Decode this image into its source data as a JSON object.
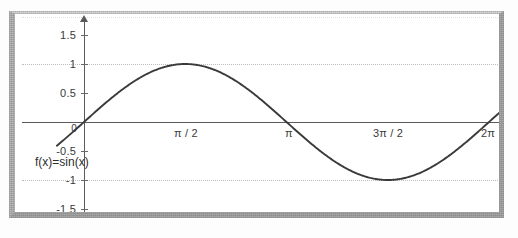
{
  "figure": {
    "series_label": "f(x)=sin(x)",
    "frame_color": "#a9a9a9",
    "curve_color": "#3a3a3a",
    "grid_color": "#bdbdbd",
    "axis_color": "#5a5a5a"
  },
  "chart_data": {
    "type": "line",
    "title": "",
    "subtitle": "",
    "xlabel": "",
    "ylabel": "",
    "grid": true,
    "legend_position": "inline-left",
    "annotations": [
      "f(x)=sin(x)"
    ],
    "series": [
      {
        "name": "f(x)=sin(x)",
        "x": [
          0,
          0.3927,
          0.7854,
          1.1781,
          1.5708,
          1.9635,
          2.3562,
          2.7489,
          3.1416,
          3.5343,
          3.927,
          4.3197,
          4.7124,
          5.1051,
          5.4978,
          5.8905,
          6.2832
        ],
        "values": [
          0,
          0.3827,
          0.7071,
          0.9239,
          1.0,
          0.9239,
          0.7071,
          0.3827,
          0,
          -0.3827,
          -0.7071,
          -0.9239,
          -1.0,
          -0.9239,
          -0.7071,
          -0.3827,
          0
        ]
      }
    ],
    "xlim": [
      -0.6,
      6.9
    ],
    "ylim": [
      -1.75,
      1.75
    ],
    "x_ticks": [
      {
        "value": 1.5708,
        "label": "π / 2"
      },
      {
        "value": 3.1416,
        "label": "π"
      },
      {
        "value": 4.7124,
        "label": "3π / 2"
      },
      {
        "value": 6.2832,
        "label": "2π"
      }
    ],
    "y_ticks": [
      {
        "value": 1.5,
        "label": "1.5"
      },
      {
        "value": 1.0,
        "label": "1"
      },
      {
        "value": 0.5,
        "label": "0.5"
      },
      {
        "value": 0.0,
        "label": "0"
      },
      {
        "value": -0.5,
        "label": "-0.5"
      },
      {
        "value": -1.0,
        "label": "-1"
      },
      {
        "value": -1.5,
        "label": "-1.5"
      }
    ],
    "gridlines_y": [
      1.5,
      1.0,
      -1.0
    ]
  }
}
